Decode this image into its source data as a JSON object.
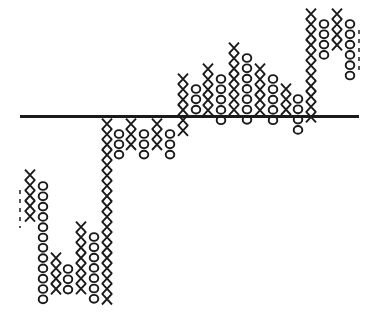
{
  "chart_data": {
    "type": "point-and-figure",
    "title": "",
    "xlabel": "",
    "ylabel": "",
    "grid": false,
    "legend": null,
    "row_pitch_px": 10.3,
    "reference_line": {
      "y_px": 116.5,
      "x_start_px": 20,
      "x_end_px": 359,
      "color": "#1a1a1a"
    },
    "symbol_color": "#1a1a1a",
    "columns": [
      {
        "index": 1,
        "type": "X",
        "x": 30,
        "top_y": 175,
        "count": 5
      },
      {
        "index": 2,
        "type": "O",
        "x": 43,
        "top_y": 186,
        "count": 12
      },
      {
        "index": 3,
        "type": "X",
        "x": 56,
        "top_y": 258,
        "count": 4
      },
      {
        "index": 4,
        "type": "O",
        "x": 68,
        "top_y": 269,
        "count": 3
      },
      {
        "index": 5,
        "type": "X",
        "x": 81,
        "top_y": 227,
        "count": 7
      },
      {
        "index": 6,
        "type": "O",
        "x": 94,
        "top_y": 237,
        "count": 7
      },
      {
        "index": 7,
        "type": "X",
        "x": 107,
        "top_y": 124,
        "count": 18
      },
      {
        "index": 8,
        "type": "O",
        "x": 119,
        "top_y": 134,
        "count": 3
      },
      {
        "index": 9,
        "type": "X",
        "x": 131,
        "top_y": 124,
        "count": 3
      },
      {
        "index": 10,
        "type": "O",
        "x": 144,
        "top_y": 134,
        "count": 3
      },
      {
        "index": 11,
        "type": "X",
        "x": 157,
        "top_y": 124,
        "count": 3
      },
      {
        "index": 12,
        "type": "O",
        "x": 170,
        "top_y": 134,
        "count": 3
      },
      {
        "index": 13,
        "type": "X",
        "x": 183,
        "top_y": 79,
        "count": 6
      },
      {
        "index": 14,
        "type": "O",
        "x": 196,
        "top_y": 89,
        "count": 3
      },
      {
        "index": 15,
        "type": "X",
        "x": 208,
        "top_y": 69,
        "count": 5
      },
      {
        "index": 16,
        "type": "O",
        "x": 221,
        "top_y": 79,
        "count": 5
      },
      {
        "index": 17,
        "type": "X",
        "x": 234,
        "top_y": 48,
        "count": 7
      },
      {
        "index": 18,
        "type": "O",
        "x": 247,
        "top_y": 58,
        "count": 7
      },
      {
        "index": 19,
        "type": "X",
        "x": 260,
        "top_y": 69,
        "count": 5
      },
      {
        "index": 20,
        "type": "O",
        "x": 273,
        "top_y": 79,
        "count": 5
      },
      {
        "index": 21,
        "type": "X",
        "x": 286,
        "top_y": 89,
        "count": 3
      },
      {
        "index": 22,
        "type": "O",
        "x": 298,
        "top_y": 99,
        "count": 4
      },
      {
        "index": 23,
        "type": "X",
        "x": 311,
        "top_y": 14,
        "count": 11
      },
      {
        "index": 24,
        "type": "O",
        "x": 324,
        "top_y": 24,
        "count": 4
      },
      {
        "index": 25,
        "type": "X",
        "x": 337,
        "top_y": 14,
        "count": 4
      },
      {
        "index": 26,
        "type": "O",
        "x": 350,
        "top_y": 24,
        "count": 6
      }
    ],
    "partial_edges": [
      {
        "side": "left",
        "x": 20,
        "y_start": 190,
        "y_end": 228
      },
      {
        "side": "right",
        "x": 359,
        "y_start": 30,
        "y_end": 75
      }
    ]
  }
}
